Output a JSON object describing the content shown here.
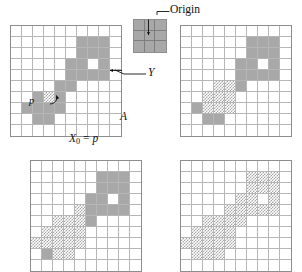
{
  "figure": {
    "caption_labels": {
      "origin": "Origin",
      "set_y": "Y",
      "set_a": "A",
      "x0_var": "X",
      "x0_sub": "0",
      "x0_eq": "=",
      "x0_val": "p",
      "point_p": "p"
    },
    "colors": {
      "solid_fill": "#a8a8a8",
      "hatch_fill": "#a8a8a8",
      "grid_line": "#b6b6b6",
      "border": "#8d8d8d",
      "background": "#ffffff",
      "annotation": "#111111"
    },
    "structuring_element": {
      "name": "origin-structuring-element",
      "rows": 3,
      "cols": 3,
      "cells": [
        [
          "solid",
          "solid",
          "solid"
        ],
        [
          "solid",
          "solid",
          "solid"
        ],
        [
          "solid",
          "solid",
          "solid"
        ]
      ]
    },
    "panels": [
      {
        "name": "panel-top-left",
        "rows": 10,
        "cols": 10,
        "cells": [
          [
            "empty",
            "empty",
            "empty",
            "empty",
            "empty",
            "empty",
            "empty",
            "empty",
            "empty",
            "empty"
          ],
          [
            "empty",
            "empty",
            "empty",
            "empty",
            "empty",
            "empty",
            "solid",
            "solid",
            "solid",
            "empty"
          ],
          [
            "empty",
            "empty",
            "empty",
            "empty",
            "empty",
            "empty",
            "solid",
            "solid",
            "solid",
            "empty"
          ],
          [
            "empty",
            "empty",
            "empty",
            "empty",
            "empty",
            "solid",
            "solid",
            "empty",
            "solid",
            "empty"
          ],
          [
            "empty",
            "empty",
            "empty",
            "empty",
            "empty",
            "solid",
            "solid",
            "solid",
            "solid",
            "empty"
          ],
          [
            "empty",
            "empty",
            "empty",
            "empty",
            "solid",
            "solid",
            "empty",
            "empty",
            "empty",
            "empty"
          ],
          [
            "empty",
            "empty",
            "solid",
            "hatch",
            "solid",
            "empty",
            "empty",
            "empty",
            "empty",
            "empty"
          ],
          [
            "empty",
            "solid",
            "solid",
            "solid",
            "solid",
            "empty",
            "empty",
            "empty",
            "empty",
            "empty"
          ],
          [
            "empty",
            "empty",
            "solid",
            "solid",
            "empty",
            "empty",
            "empty",
            "empty",
            "empty",
            "empty"
          ],
          [
            "empty",
            "empty",
            "empty",
            "empty",
            "empty",
            "empty",
            "empty",
            "empty",
            "empty",
            "empty"
          ]
        ]
      },
      {
        "name": "panel-top-right",
        "rows": 10,
        "cols": 10,
        "cells": [
          [
            "empty",
            "empty",
            "empty",
            "empty",
            "empty",
            "empty",
            "empty",
            "empty",
            "empty",
            "empty"
          ],
          [
            "empty",
            "empty",
            "empty",
            "empty",
            "empty",
            "empty",
            "solid",
            "solid",
            "solid",
            "empty"
          ],
          [
            "empty",
            "empty",
            "empty",
            "empty",
            "empty",
            "empty",
            "solid",
            "solid",
            "solid",
            "empty"
          ],
          [
            "empty",
            "empty",
            "empty",
            "empty",
            "empty",
            "solid",
            "solid",
            "empty",
            "solid",
            "empty"
          ],
          [
            "empty",
            "empty",
            "empty",
            "empty",
            "empty",
            "solid",
            "solid",
            "solid",
            "solid",
            "empty"
          ],
          [
            "empty",
            "empty",
            "empty",
            "hatch",
            "hatch",
            "solid",
            "empty",
            "empty",
            "empty",
            "empty"
          ],
          [
            "empty",
            "empty",
            "hatch",
            "hatch",
            "hatch",
            "empty",
            "empty",
            "empty",
            "empty",
            "empty"
          ],
          [
            "empty",
            "solid",
            "hatch",
            "hatch",
            "hatch",
            "empty",
            "empty",
            "empty",
            "empty",
            "empty"
          ],
          [
            "empty",
            "empty",
            "solid",
            "solid",
            "empty",
            "empty",
            "empty",
            "empty",
            "empty",
            "empty"
          ],
          [
            "empty",
            "empty",
            "empty",
            "empty",
            "empty",
            "empty",
            "empty",
            "empty",
            "empty",
            "empty"
          ]
        ]
      },
      {
        "name": "panel-bottom-left",
        "rows": 10,
        "cols": 10,
        "cells": [
          [
            "empty",
            "empty",
            "empty",
            "empty",
            "empty",
            "empty",
            "empty",
            "empty",
            "empty",
            "empty"
          ],
          [
            "empty",
            "empty",
            "empty",
            "empty",
            "empty",
            "empty",
            "solid",
            "solid",
            "solid",
            "empty"
          ],
          [
            "empty",
            "empty",
            "empty",
            "empty",
            "empty",
            "empty",
            "solid",
            "solid",
            "solid",
            "empty"
          ],
          [
            "empty",
            "empty",
            "empty",
            "empty",
            "empty",
            "solid",
            "solid",
            "empty",
            "solid",
            "empty"
          ],
          [
            "empty",
            "empty",
            "empty",
            "empty",
            "hatch",
            "solid",
            "solid",
            "solid",
            "solid",
            "empty"
          ],
          [
            "empty",
            "empty",
            "hatch",
            "hatch",
            "hatch",
            "solid",
            "empty",
            "empty",
            "empty",
            "empty"
          ],
          [
            "empty",
            "hatch",
            "hatch",
            "hatch",
            "hatch",
            "empty",
            "empty",
            "empty",
            "empty",
            "empty"
          ],
          [
            "hatch",
            "hatch",
            "hatch",
            "hatch",
            "hatch",
            "empty",
            "empty",
            "empty",
            "empty",
            "empty"
          ],
          [
            "empty",
            "solid",
            "hatch",
            "hatch",
            "empty",
            "empty",
            "empty",
            "empty",
            "empty",
            "empty"
          ],
          [
            "empty",
            "empty",
            "empty",
            "empty",
            "empty",
            "empty",
            "empty",
            "empty",
            "empty",
            "empty"
          ]
        ]
      },
      {
        "name": "panel-bottom-right",
        "rows": 10,
        "cols": 10,
        "cells": [
          [
            "empty",
            "empty",
            "empty",
            "empty",
            "empty",
            "empty",
            "empty",
            "empty",
            "empty",
            "empty"
          ],
          [
            "empty",
            "empty",
            "empty",
            "empty",
            "empty",
            "empty",
            "hatch",
            "hatch",
            "hatch",
            "empty"
          ],
          [
            "empty",
            "empty",
            "empty",
            "empty",
            "empty",
            "empty",
            "hatch",
            "hatch",
            "hatch",
            "empty"
          ],
          [
            "empty",
            "empty",
            "empty",
            "empty",
            "empty",
            "hatch",
            "hatch",
            "empty",
            "hatch",
            "empty"
          ],
          [
            "empty",
            "empty",
            "empty",
            "empty",
            "hatch",
            "hatch",
            "hatch",
            "hatch",
            "hatch",
            "empty"
          ],
          [
            "empty",
            "empty",
            "hatch",
            "hatch",
            "hatch",
            "hatch",
            "empty",
            "empty",
            "empty",
            "empty"
          ],
          [
            "empty",
            "hatch",
            "hatch",
            "hatch",
            "hatch",
            "empty",
            "empty",
            "empty",
            "empty",
            "empty"
          ],
          [
            "hatch",
            "hatch",
            "hatch",
            "hatch",
            "hatch",
            "empty",
            "empty",
            "empty",
            "empty",
            "empty"
          ],
          [
            "empty",
            "hatch",
            "hatch",
            "hatch",
            "empty",
            "empty",
            "empty",
            "empty",
            "empty",
            "empty"
          ],
          [
            "empty",
            "empty",
            "empty",
            "empty",
            "empty",
            "empty",
            "empty",
            "empty",
            "empty",
            "empty"
          ]
        ]
      }
    ]
  }
}
